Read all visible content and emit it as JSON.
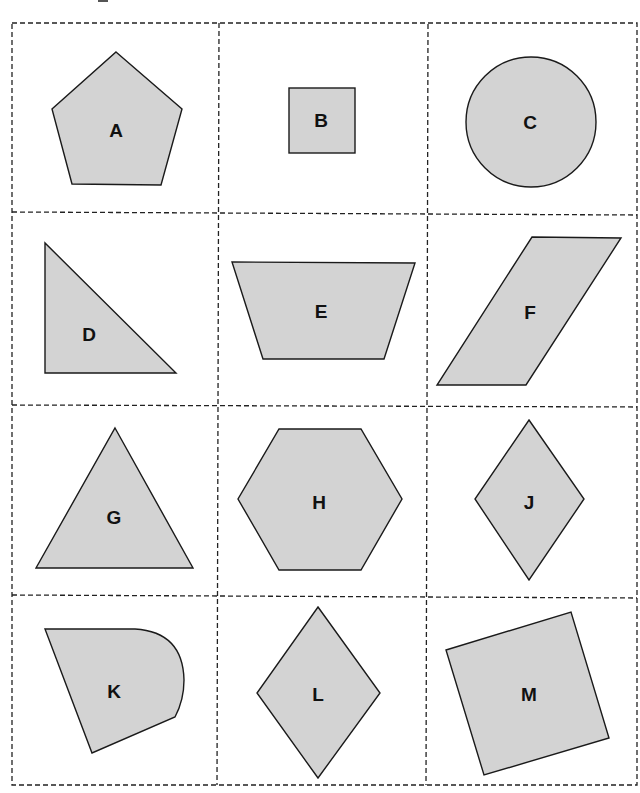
{
  "diagram": {
    "type": "shape-cards-grid",
    "rows": 4,
    "columns": 3,
    "card_border_style": "dashed",
    "shape_fill": "#d3d3d3",
    "shape_stroke": "#1a1a1a",
    "cards": [
      {
        "label": "A",
        "shape": "pentagon"
      },
      {
        "label": "B",
        "shape": "square"
      },
      {
        "label": "C",
        "shape": "circle"
      },
      {
        "label": "D",
        "shape": "right-triangle"
      },
      {
        "label": "E",
        "shape": "trapezoid"
      },
      {
        "label": "F",
        "shape": "parallelogram"
      },
      {
        "label": "G",
        "shape": "triangle"
      },
      {
        "label": "H",
        "shape": "hexagon"
      },
      {
        "label": "J",
        "shape": "rhombus"
      },
      {
        "label": "K",
        "shape": "quadrilateral-with-curved-side"
      },
      {
        "label": "L",
        "shape": "rhombus"
      },
      {
        "label": "M",
        "shape": "tilted-square"
      }
    ]
  }
}
